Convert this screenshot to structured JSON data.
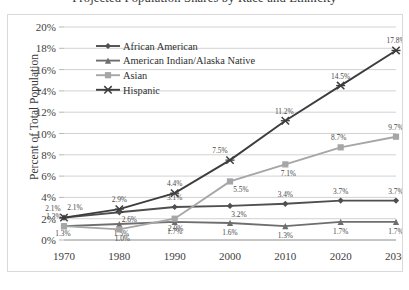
{
  "chart_data": {
    "type": "line",
    "title": "Projected Population Shares by Race and Ethnicity",
    "xlabel": "",
    "ylabel": "Percent of Total Population",
    "categories": [
      "1970",
      "1980",
      "1990",
      "2000",
      "2010",
      "2020",
      "2030"
    ],
    "x": [
      1970,
      1980,
      1990,
      2000,
      2010,
      2020,
      2030
    ],
    "ylim": [
      0,
      20
    ],
    "ytick_labels": [
      "0%",
      "2%",
      "4%",
      "6%",
      "8%",
      "10%",
      "12%",
      "14%",
      "16%",
      "18%",
      "20%"
    ],
    "ytick_values": [
      0,
      2,
      4,
      6,
      8,
      10,
      12,
      14,
      16,
      18,
      20
    ],
    "grid": true,
    "legend_position": "upper-left-inside",
    "value_labels": true,
    "value_label_suffix": "%",
    "series": [
      {
        "name": "African American",
        "marker": "diamond",
        "color": "#4f4f4f",
        "values": [
          2.1,
          2.6,
          3.1,
          3.2,
          3.4,
          3.7,
          3.7
        ],
        "labels": [
          "2.1%",
          "2.6%",
          "3.1%",
          "3.2%",
          "3.4%",
          "3.7%",
          "3.7%"
        ]
      },
      {
        "name": "American Indian/Alaska Native",
        "marker": "triangle",
        "color": "#6e6e6e",
        "values": [
          1.3,
          1.5,
          1.7,
          1.6,
          1.3,
          1.7,
          1.7
        ],
        "labels": [
          "1.3%",
          "1.5%",
          "1.7%",
          "1.6%",
          "1.3%",
          "1.7%",
          "1.7%"
        ]
      },
      {
        "name": "Asian",
        "marker": "square",
        "color": "#a6a6a6",
        "values": [
          1.3,
          1.0,
          2.0,
          5.5,
          7.1,
          8.7,
          9.7
        ],
        "labels": [
          "1.3%",
          "1.0%",
          "2.0%",
          "5.5%",
          "7.1%",
          "8.7%",
          "9.7%"
        ]
      },
      {
        "name": "Hispanic",
        "marker": "cross",
        "color": "#3d3d3d",
        "values": [
          2.1,
          2.9,
          4.4,
          7.5,
          11.2,
          14.5,
          17.8
        ],
        "labels": [
          "2.1%",
          "2.9%",
          "4.4%",
          "7.5%",
          "11.2%",
          "14.5%",
          "17.8%"
        ]
      }
    ]
  }
}
